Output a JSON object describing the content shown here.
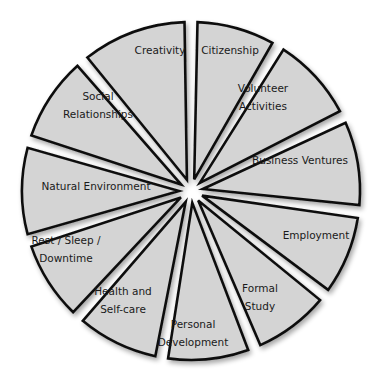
{
  "diagram": {
    "type": "segmented-wheel",
    "segment_count": 12,
    "colors": {
      "fill": "#d4d4d4",
      "stroke": "#111111",
      "center": "#ffffff",
      "text": "#1a1a1a"
    },
    "segments": [
      {
        "label_lines": [
          "Citizenship"
        ]
      },
      {
        "label_lines": [
          "Volunteer",
          "Activities"
        ]
      },
      {
        "label_lines": [
          "Business Ventures"
        ]
      },
      {
        "label_lines": [
          "Employment"
        ]
      },
      {
        "label_lines": [
          "Formal",
          "Study"
        ]
      },
      {
        "label_lines": [
          "Personal",
          "Development"
        ]
      },
      {
        "label_lines": [
          "Health and",
          "Self-care"
        ]
      },
      {
        "label_lines": [
          "Rest / Sleep /",
          "Downtime"
        ]
      },
      {
        "label_lines": [
          "Natural Environment"
        ]
      },
      {
        "label_lines": [
          "Social",
          "Relationships"
        ]
      },
      {
        "label_lines": [
          "Creativity"
        ]
      }
    ]
  }
}
